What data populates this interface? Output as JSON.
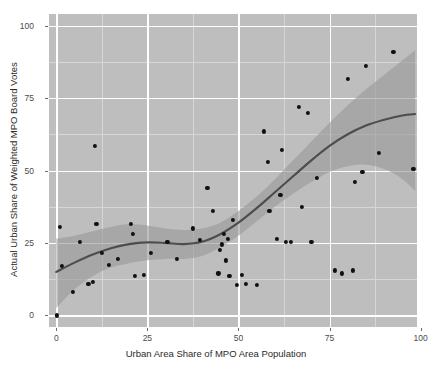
{
  "chart_data": {
    "type": "scatter",
    "title": "",
    "xlabel": "Urban Area Share of MPO Area Population",
    "ylabel": "Actual Urban Share of Weighted MPO Board Votes",
    "xlim": [
      -2,
      99
    ],
    "ylim": [
      -4,
      104
    ],
    "xticks": [
      0,
      25,
      50,
      75,
      100
    ],
    "yticks": [
      0,
      25,
      50,
      75,
      100
    ],
    "xtick_labels": [
      "0",
      "25",
      "50",
      "75",
      "100"
    ],
    "ytick_labels": [
      "0",
      "25",
      "50",
      "75",
      "100"
    ],
    "grid": true,
    "legend": "none",
    "panel_color": "#bebebe",
    "grid_color": "#ffffff",
    "point_color": "#101010",
    "line_color": "#4d4d4d",
    "band_color": "#9a9a9a",
    "points": [
      {
        "x": 0.2,
        "y": 0.0
      },
      {
        "x": 1.0,
        "y": 30.5
      },
      {
        "x": 1.5,
        "y": 17.0
      },
      {
        "x": 4.5,
        "y": 8.0
      },
      {
        "x": 6.5,
        "y": 25.5
      },
      {
        "x": 8.8,
        "y": 11.0
      },
      {
        "x": 10.0,
        "y": 11.5
      },
      {
        "x": 10.5,
        "y": 58.5
      },
      {
        "x": 11.0,
        "y": 31.5
      },
      {
        "x": 12.5,
        "y": 21.5
      },
      {
        "x": 14.5,
        "y": 17.5
      },
      {
        "x": 17.0,
        "y": 19.5
      },
      {
        "x": 20.5,
        "y": 31.5
      },
      {
        "x": 21.0,
        "y": 28.0
      },
      {
        "x": 21.5,
        "y": 13.5
      },
      {
        "x": 24.0,
        "y": 14.0
      },
      {
        "x": 26.0,
        "y": 21.5
      },
      {
        "x": 30.5,
        "y": 25.5
      },
      {
        "x": 33.0,
        "y": 19.5
      },
      {
        "x": 37.5,
        "y": 30.0
      },
      {
        "x": 39.5,
        "y": 26.0
      },
      {
        "x": 41.5,
        "y": 44.0
      },
      {
        "x": 43.0,
        "y": 36.0
      },
      {
        "x": 44.5,
        "y": 14.5
      },
      {
        "x": 45.0,
        "y": 22.5
      },
      {
        "x": 45.5,
        "y": 24.5
      },
      {
        "x": 46.0,
        "y": 28.0
      },
      {
        "x": 46.5,
        "y": 19.0
      },
      {
        "x": 47.0,
        "y": 26.5
      },
      {
        "x": 47.5,
        "y": 13.5
      },
      {
        "x": 48.5,
        "y": 33.0
      },
      {
        "x": 49.5,
        "y": 10.5
      },
      {
        "x": 51.0,
        "y": 14.0
      },
      {
        "x": 52.0,
        "y": 11.0
      },
      {
        "x": 55.0,
        "y": 10.5
      },
      {
        "x": 57.0,
        "y": 63.5
      },
      {
        "x": 58.0,
        "y": 53.0
      },
      {
        "x": 58.5,
        "y": 36.0
      },
      {
        "x": 60.5,
        "y": 26.5
      },
      {
        "x": 61.5,
        "y": 41.5
      },
      {
        "x": 62.0,
        "y": 57.0
      },
      {
        "x": 63.0,
        "y": 25.5
      },
      {
        "x": 64.5,
        "y": 25.5
      },
      {
        "x": 66.5,
        "y": 72.0
      },
      {
        "x": 67.5,
        "y": 37.5
      },
      {
        "x": 69.0,
        "y": 70.0
      },
      {
        "x": 70.0,
        "y": 25.5
      },
      {
        "x": 71.5,
        "y": 47.5
      },
      {
        "x": 76.5,
        "y": 15.5
      },
      {
        "x": 78.5,
        "y": 14.5
      },
      {
        "x": 80.0,
        "y": 81.5
      },
      {
        "x": 81.5,
        "y": 15.5
      },
      {
        "x": 82.0,
        "y": 46.0
      },
      {
        "x": 84.0,
        "y": 49.5
      },
      {
        "x": 85.0,
        "y": 86.0
      },
      {
        "x": 88.5,
        "y": 56.0
      },
      {
        "x": 92.5,
        "y": 91.0
      },
      {
        "x": 98.0,
        "y": 50.5
      }
    ],
    "trend_line": [
      {
        "x": 0.0,
        "y": 15.0
      },
      {
        "x": 5.0,
        "y": 18.2
      },
      {
        "x": 10.0,
        "y": 21.0
      },
      {
        "x": 15.0,
        "y": 23.2
      },
      {
        "x": 20.0,
        "y": 24.6
      },
      {
        "x": 25.0,
        "y": 25.2
      },
      {
        "x": 30.0,
        "y": 25.0
      },
      {
        "x": 35.0,
        "y": 24.6
      },
      {
        "x": 40.0,
        "y": 25.4
      },
      {
        "x": 45.0,
        "y": 28.0
      },
      {
        "x": 50.0,
        "y": 32.0
      },
      {
        "x": 55.0,
        "y": 37.0
      },
      {
        "x": 60.0,
        "y": 42.5
      },
      {
        "x": 65.0,
        "y": 48.0
      },
      {
        "x": 70.0,
        "y": 53.5
      },
      {
        "x": 75.0,
        "y": 58.5
      },
      {
        "x": 80.0,
        "y": 62.5
      },
      {
        "x": 85.0,
        "y": 65.5
      },
      {
        "x": 90.0,
        "y": 67.5
      },
      {
        "x": 95.0,
        "y": 69.0
      },
      {
        "x": 98.5,
        "y": 69.5
      }
    ],
    "confidence_band_upper": [
      {
        "x": 0.0,
        "y": 26.5
      },
      {
        "x": 5.0,
        "y": 27.5
      },
      {
        "x": 10.0,
        "y": 29.0
      },
      {
        "x": 15.0,
        "y": 30.5
      },
      {
        "x": 20.0,
        "y": 31.5
      },
      {
        "x": 25.0,
        "y": 31.0
      },
      {
        "x": 30.0,
        "y": 30.0
      },
      {
        "x": 35.0,
        "y": 29.5
      },
      {
        "x": 40.0,
        "y": 30.0
      },
      {
        "x": 45.0,
        "y": 32.0
      },
      {
        "x": 50.0,
        "y": 36.0
      },
      {
        "x": 55.0,
        "y": 41.0
      },
      {
        "x": 60.0,
        "y": 47.0
      },
      {
        "x": 65.0,
        "y": 53.5
      },
      {
        "x": 70.0,
        "y": 60.0
      },
      {
        "x": 75.0,
        "y": 66.5
      },
      {
        "x": 80.0,
        "y": 72.5
      },
      {
        "x": 85.0,
        "y": 78.0
      },
      {
        "x": 90.0,
        "y": 83.0
      },
      {
        "x": 95.0,
        "y": 88.0
      },
      {
        "x": 98.5,
        "y": 91.5
      }
    ],
    "confidence_band_lower": [
      {
        "x": 0.0,
        "y": 2.5
      },
      {
        "x": 5.0,
        "y": 9.0
      },
      {
        "x": 10.0,
        "y": 13.5
      },
      {
        "x": 15.0,
        "y": 16.5
      },
      {
        "x": 20.0,
        "y": 18.0
      },
      {
        "x": 25.0,
        "y": 19.0
      },
      {
        "x": 30.0,
        "y": 19.5
      },
      {
        "x": 35.0,
        "y": 19.5
      },
      {
        "x": 40.0,
        "y": 20.5
      },
      {
        "x": 45.0,
        "y": 23.5
      },
      {
        "x": 50.0,
        "y": 27.5
      },
      {
        "x": 55.0,
        "y": 32.5
      },
      {
        "x": 60.0,
        "y": 37.5
      },
      {
        "x": 65.0,
        "y": 42.0
      },
      {
        "x": 70.0,
        "y": 46.0
      },
      {
        "x": 75.0,
        "y": 49.5
      },
      {
        "x": 80.0,
        "y": 51.5
      },
      {
        "x": 85.0,
        "y": 52.0
      },
      {
        "x": 90.0,
        "y": 50.5
      },
      {
        "x": 95.0,
        "y": 47.0
      },
      {
        "x": 98.5,
        "y": 43.0
      }
    ]
  }
}
